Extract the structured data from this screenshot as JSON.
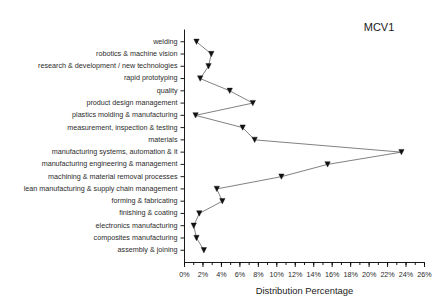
{
  "chart_data": {
    "type": "line",
    "title": "",
    "annotation": "MCV1",
    "xlabel": "Distribution Percentage",
    "ylabel": "",
    "xlim": [
      0,
      26
    ],
    "xtick_step": 2,
    "xminor_step": 1,
    "grid": false,
    "legend_position": "none",
    "orientation": "horizontal",
    "marker": "triangle-down",
    "xticklabels": [
      "0%",
      "2%",
      "4%",
      "6%",
      "8%",
      "10%",
      "12%",
      "14%",
      "16%",
      "18%",
      "20%",
      "22%",
      "24%",
      "26%"
    ],
    "xtickvalues": [
      0,
      2,
      4,
      6,
      8,
      10,
      12,
      14,
      16,
      18,
      20,
      22,
      24,
      26
    ],
    "categories": [
      "welding",
      "robotics & machine vision",
      "research & development / new technologies",
      "rapid prototyping",
      "quality",
      "product design management",
      "plastics molding & manufacturing",
      "measurement, inspection & testing",
      "materials",
      "manufacturing systems, automation & it",
      "manufacturing engineering & management",
      "machining & material removal processes",
      "lean manufacturing & supply chain management",
      "forming & fabricating",
      "finishing & coating",
      "electronics manufacturing",
      "composites manufacturing",
      "assembly & joining"
    ],
    "values": [
      1.3,
      2.9,
      2.6,
      1.7,
      4.9,
      7.4,
      1.2,
      6.3,
      7.6,
      23.5,
      15.5,
      10.5,
      3.5,
      4.1,
      1.6,
      1.0,
      1.3,
      2.1
    ],
    "series": [
      {
        "name": "MCV1",
        "values": [
          1.3,
          2.9,
          2.6,
          1.7,
          4.9,
          7.4,
          1.2,
          6.3,
          7.6,
          23.5,
          15.5,
          10.5,
          3.5,
          4.1,
          1.6,
          1.0,
          1.3,
          2.1
        ]
      }
    ],
    "colors": {
      "line": "#4a4a4a",
      "marker": "#111111",
      "axis": "#000000",
      "text": "#1a1a1a",
      "background": "#ffffff"
    }
  }
}
